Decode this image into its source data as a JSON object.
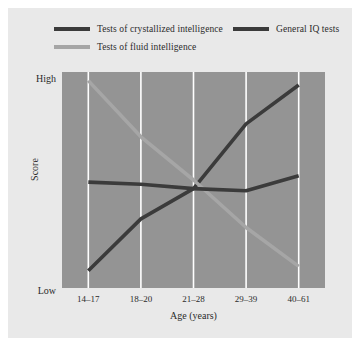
{
  "chart_data": {
    "type": "line",
    "title": "",
    "xlabel": "Age (years)",
    "ylabel": "Score",
    "categories": [
      "14–17",
      "18–20",
      "21–28",
      "29–39",
      "40–61"
    ],
    "ytick_labels": [
      "High",
      "Low"
    ],
    "ylim": [
      0,
      100
    ],
    "grid": true,
    "grid_color": "#ffffff",
    "plot_background": "#949494",
    "legend_position": "top",
    "series": [
      {
        "name": "Tests of crystallized intelligence",
        "color": "#3b3b3b",
        "values": [
          8,
          32,
          46,
          76,
          94
        ]
      },
      {
        "name": "Tests of fluid intelligence",
        "color": "#a6a6a6",
        "values": [
          96,
          70,
          50,
          28,
          10
        ]
      },
      {
        "name": "General IQ tests",
        "color": "#3b3b3b",
        "values": [
          49,
          48,
          46,
          45,
          52
        ]
      }
    ]
  },
  "legend": {
    "entries": [
      {
        "label": "Tests of crystallized intelligence",
        "swatch": "dark"
      },
      {
        "label": "General IQ tests",
        "swatch": "dark"
      },
      {
        "label": "Tests of fluid intelligence",
        "swatch": "light"
      }
    ]
  },
  "axes": {
    "y_high": "High",
    "y_low": "Low",
    "y_title": "Score",
    "x_title": "Age (years)"
  },
  "colors": {
    "page_background": "#ffffff",
    "panel_background": "#e9e9e9",
    "plot_background": "#949494",
    "gridline": "#ffffff",
    "dark_series": "#3b3b3b",
    "light_series": "#a6a6a6",
    "text": "#2b2b2b"
  }
}
